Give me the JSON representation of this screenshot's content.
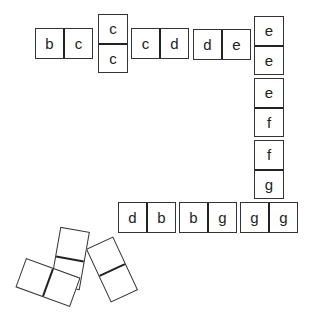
{
  "board": {
    "placed_dominoes": [
      {
        "id": "d1",
        "orientation": "h",
        "left": "b",
        "right": "c",
        "x": 35,
        "y": 28
      },
      {
        "id": "d2",
        "orientation": "v",
        "left": "c",
        "right": "c",
        "x": 98,
        "y": 14
      },
      {
        "id": "d3",
        "orientation": "h",
        "left": "c",
        "right": "d",
        "x": 131,
        "y": 28
      },
      {
        "id": "d4",
        "orientation": "h",
        "left": "d",
        "right": "e",
        "x": 193,
        "y": 29
      },
      {
        "id": "d5",
        "orientation": "v",
        "left": "e",
        "right": "e",
        "x": 254,
        "y": 16
      },
      {
        "id": "d6",
        "orientation": "v",
        "left": "e",
        "right": "f",
        "x": 254,
        "y": 78
      },
      {
        "id": "d7",
        "orientation": "v",
        "left": "f",
        "right": "g",
        "x": 254,
        "y": 140
      },
      {
        "id": "d8",
        "orientation": "h",
        "left": "d",
        "right": "b",
        "x": 118,
        "y": 202
      },
      {
        "id": "d9",
        "orientation": "h",
        "left": "b",
        "right": "g",
        "x": 179,
        "y": 202
      },
      {
        "id": "d10",
        "orientation": "h",
        "left": "g",
        "right": "g",
        "x": 240,
        "y": 202
      }
    ],
    "loose_blank_dominoes": [
      {
        "id": "b1",
        "orientation": "v",
        "cx": 70,
        "cy": 259,
        "rotate": 10
      },
      {
        "id": "b2",
        "orientation": "h",
        "cx": 48,
        "cy": 282,
        "rotate": 20
      },
      {
        "id": "b3",
        "orientation": "v",
        "cx": 112,
        "cy": 269,
        "rotate": -25
      }
    ]
  },
  "labels": {
    "d1": {
      "a": "b",
      "b": "c"
    },
    "d2": {
      "a": "c",
      "b": "c"
    },
    "d3": {
      "a": "c",
      "b": "d"
    },
    "d4": {
      "a": "d",
      "b": "e"
    },
    "d5": {
      "a": "e",
      "b": "e"
    },
    "d6": {
      "a": "e",
      "b": "f"
    },
    "d7": {
      "a": "f",
      "b": "g"
    },
    "d8": {
      "a": "d",
      "b": "b"
    },
    "d9": {
      "a": "b",
      "b": "g"
    },
    "d10": {
      "a": "g",
      "b": "g"
    }
  }
}
